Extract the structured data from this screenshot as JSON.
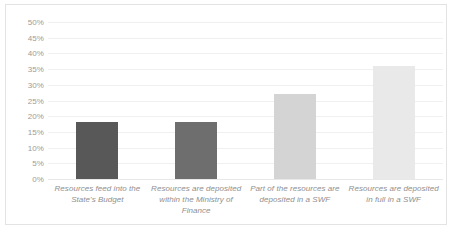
{
  "chart_data": {
    "type": "bar",
    "title": "",
    "subtitle": "",
    "xlabel": "",
    "ylabel": "",
    "categories": [
      "Resources feed into the State's Budget",
      "Resources are deposited within the Ministry of Finance",
      "Part of the resources are deposited in a SWF",
      "Resources are deposited in full in a SWF"
    ],
    "values": [
      18,
      18,
      27,
      36
    ],
    "value_labels": [
      "18%",
      "18%",
      "27%",
      "36%"
    ],
    "ylim": [
      0,
      50
    ],
    "ytick_values": [
      0,
      5,
      10,
      15,
      20,
      25,
      30,
      35,
      40,
      45,
      50
    ],
    "ytick_labels": [
      "0%",
      "5%",
      "10%",
      "15%",
      "20%",
      "25%",
      "30%",
      "35%",
      "40%",
      "45%",
      "50%"
    ],
    "grid": true,
    "legend": "none",
    "bar_colors": [
      "#585858",
      "#6e6e6e",
      "#d4d4d4",
      "#e9e9e9"
    ],
    "grid_color": "#f0f0f0",
    "axis_text_color": "#9b9b9b",
    "category_text_color": "#8f8f8f",
    "border_color": "#e3e3e3",
    "background_color": "#ffffff"
  }
}
